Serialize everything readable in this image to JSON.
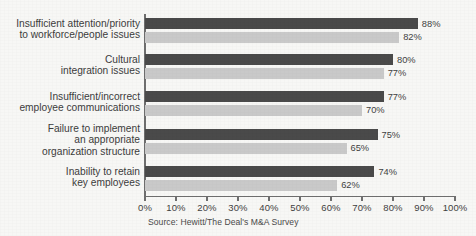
{
  "chart_data": {
    "type": "bar",
    "orientation": "horizontal",
    "title": "",
    "subtitle": "",
    "xlabel": "",
    "ylabel": "",
    "xlim": [
      0,
      100
    ],
    "grid": false,
    "legend": "none",
    "value_suffix": "%",
    "categories": [
      "Insufficient attention/priority\nto workforce/people issues",
      "Cultural\nintegration issues",
      "Insufficient/incorrect\nemployee communications",
      "Failure to implement\nan appropriate\norganization structure",
      "Inability to retain\nkey employees"
    ],
    "category_lines": [
      [
        "Insufficient attention/priority",
        "to workforce/people issues"
      ],
      [
        "Cultural",
        "integration issues"
      ],
      [
        "Insufficient/incorrect",
        "employee communications"
      ],
      [
        "Failure to implement",
        "an appropriate",
        "organization structure"
      ],
      [
        "Inability to retain",
        "key employees"
      ]
    ],
    "series": [
      {
        "name": "series-dark",
        "color": "#4a4a4a",
        "values": [
          88,
          80,
          77,
          75,
          74
        ]
      },
      {
        "name": "series-light",
        "color": "#c9c9c9",
        "values": [
          82,
          77,
          70,
          65,
          62
        ]
      }
    ],
    "value_labels": [
      [
        "88%",
        "82%"
      ],
      [
        "80%",
        "77%"
      ],
      [
        "77%",
        "70%"
      ],
      [
        "75%",
        "65%"
      ],
      [
        "74%",
        "62%"
      ]
    ],
    "xticks": [
      0,
      10,
      20,
      30,
      40,
      50,
      60,
      70,
      80,
      90,
      100
    ],
    "xtick_labels": [
      "0%",
      "10%",
      "20%",
      "30%",
      "40%",
      "50%",
      "60%",
      "70%",
      "80%",
      "90%",
      "100%"
    ]
  },
  "source_note": "Source: Hewitt/The Deal's M&A Survey",
  "colors": {
    "background": "#f7f7f5",
    "axis": "#6e6e6e",
    "text": "#3c3c3c",
    "bar_dark": "#4a4a4a",
    "bar_light": "#c9c9c9"
  }
}
